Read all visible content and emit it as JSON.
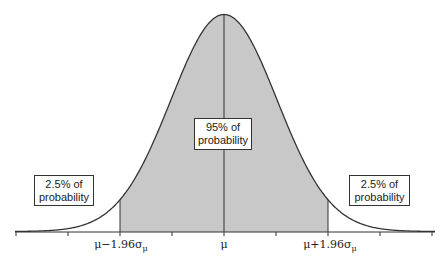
{
  "chart_data": {
    "type": "area",
    "title": "",
    "distribution": {
      "mean": "μ",
      "sd": "σμ"
    },
    "shaded_region": {
      "from_z": -1.96,
      "to_z": 1.96,
      "label": "95% of probability"
    },
    "tails": [
      {
        "side": "left",
        "label": "2.5% of probability"
      },
      {
        "side": "right",
        "label": "2.5% of probability"
      }
    ],
    "x_ticks": [
      {
        "z": -1.96,
        "label": "μ−1.96σμ"
      },
      {
        "z": 0,
        "label": "μ"
      },
      {
        "z": 1.96,
        "label": "μ+1.96σμ"
      }
    ],
    "xlabel": "",
    "ylabel": "",
    "grid": false
  },
  "labels": {
    "center_line1": "95% of",
    "center_line2": "probability",
    "left_line1": "2.5% of",
    "left_line2": "probability",
    "right_line1": "2.5% of",
    "right_line2": "probability",
    "tick_left_main": "μ−1.96σ",
    "tick_left_sub": "μ",
    "tick_center": "μ",
    "tick_right_main": "μ+1.96σ",
    "tick_right_sub": "μ"
  },
  "colors": {
    "fill": "#c8c8c8",
    "stroke": "#333333"
  }
}
